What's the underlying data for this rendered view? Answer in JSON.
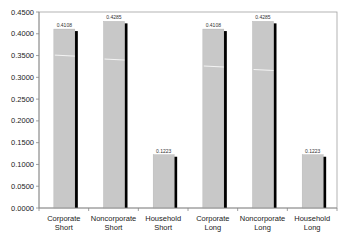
{
  "chart_data": {
    "type": "bar",
    "title": "",
    "xlabel": "",
    "ylabel": "",
    "ylim": [
      0,
      0.45
    ],
    "yticks": [
      "0.0000",
      "0.0500",
      "0.1000",
      "0.1500",
      "0.2000",
      "0.2500",
      "0.3000",
      "0.3500",
      "0.4000",
      "0.4500"
    ],
    "grid": false,
    "legend": null,
    "categories": [
      [
        "Corporate",
        "Short"
      ],
      [
        "Noncorporate",
        "Short"
      ],
      [
        "Household",
        "Short"
      ],
      [
        "Corporate",
        "Long"
      ],
      [
        "Noncorporate",
        "Long"
      ],
      [
        "Household",
        "Long"
      ]
    ],
    "values": [
      0.4108,
      0.4285,
      0.1223,
      0.4108,
      0.4285,
      0.1223
    ],
    "data_labels": [
      "0.4108",
      "0.4285",
      "0.1223",
      "0.4108",
      "0.4285",
      "0.1223"
    ],
    "inner_marker_values": [
      0.351,
      0.342,
      null,
      0.326,
      0.318,
      null
    ],
    "colors": {
      "bar_fill": "#c8c8c8",
      "bar_shadow": "#000000",
      "inner_marker": "#ffffff",
      "axis": "#888888"
    }
  }
}
